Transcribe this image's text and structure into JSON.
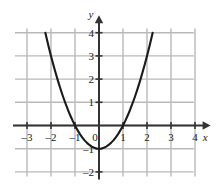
{
  "figure": {
    "name": "parabola-graph",
    "background_color": "#ffffff",
    "grid_color": "#b9b9b9",
    "axis_color": "#333333",
    "curve_color": "#1a1a1a"
  },
  "axes": {
    "x_axis_label": "x",
    "y_axis_label": "y",
    "x_ticks": [
      {
        "value": -3,
        "label": "–3"
      },
      {
        "value": -2,
        "label": "–2"
      },
      {
        "value": -1,
        "label": "–1"
      },
      {
        "value": 1,
        "label": "1"
      },
      {
        "value": 2,
        "label": "2"
      },
      {
        "value": 3,
        "label": "3"
      },
      {
        "value": 4,
        "label": "4"
      }
    ],
    "y_ticks": [
      {
        "value": 4,
        "label": "4"
      },
      {
        "value": 3,
        "label": "3"
      },
      {
        "value": 2,
        "label": "2"
      },
      {
        "value": 1,
        "label": "1"
      },
      {
        "value": -1,
        "label": "–1"
      },
      {
        "value": -2,
        "label": "–2"
      }
    ],
    "origin_label": "0"
  },
  "chart_data": {
    "type": "line",
    "title": "",
    "xlabel": "x",
    "ylabel": "y",
    "xlim": [
      -3.6,
      4.4
    ],
    "ylim": [
      -2.35,
      4.35
    ],
    "grid": true,
    "legend": null,
    "series": [
      {
        "name": "y = x^2 - 1",
        "equation": "y = x² − 1",
        "vertex": [
          0,
          -1
        ],
        "x_intercepts": [
          -1,
          1
        ],
        "y_intercept": -1,
        "x": [
          -2.236,
          -2.1,
          -2.0,
          -1.9,
          -1.8,
          -1.7,
          -1.6,
          -1.5,
          -1.4,
          -1.3,
          -1.2,
          -1.1,
          -1.0,
          -0.9,
          -0.8,
          -0.7,
          -0.6,
          -0.5,
          -0.4,
          -0.3,
          -0.2,
          -0.1,
          0.0,
          0.1,
          0.2,
          0.3,
          0.4,
          0.5,
          0.6,
          0.7,
          0.8,
          0.9,
          1.0,
          1.1,
          1.2,
          1.3,
          1.4,
          1.5,
          1.6,
          1.7,
          1.8,
          1.9,
          2.0,
          2.1,
          2.236
        ],
        "y": [
          4.0,
          3.41,
          3.0,
          2.61,
          2.24,
          1.89,
          1.56,
          1.25,
          0.96,
          0.69,
          0.44,
          0.21,
          0.0,
          -0.19,
          -0.36,
          -0.51,
          -0.64,
          -0.75,
          -0.84,
          -0.91,
          -0.96,
          -0.99,
          -1.0,
          -0.99,
          -0.96,
          -0.91,
          -0.84,
          -0.75,
          -0.64,
          -0.51,
          -0.36,
          -0.19,
          0.0,
          0.21,
          0.44,
          0.69,
          0.96,
          1.25,
          1.56,
          1.89,
          2.24,
          2.61,
          3.0,
          3.41,
          4.0
        ]
      }
    ],
    "grid_x_lines": [
      -3,
      -2,
      -1,
      0,
      1,
      2,
      3,
      4
    ],
    "grid_y_lines": [
      -2,
      -1,
      0,
      1,
      2,
      3,
      4
    ]
  }
}
